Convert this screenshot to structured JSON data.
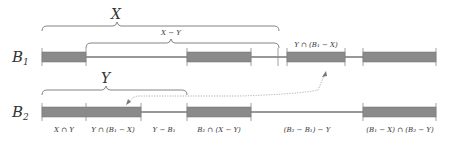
{
  "diagram": {
    "colors": {
      "bar_fill": "#8a8a8a",
      "bar_stroke": "#6e6e6e",
      "line": "#333333",
      "tick": "#888888",
      "brace": "#777777",
      "dotted": "#999999",
      "text": "#333333"
    },
    "rows": [
      {
        "id": "B1",
        "label": "B",
        "subscript": "1",
        "segments": [
          {
            "type": "block",
            "x0": 42,
            "x1": 86
          },
          {
            "type": "line",
            "x0": 86,
            "x1": 187
          },
          {
            "type": "block",
            "x0": 187,
            "x1": 251
          },
          {
            "type": "line",
            "x0": 251,
            "x1": 287
          },
          {
            "type": "block",
            "x0": 287,
            "x1": 345
          },
          {
            "type": "line",
            "x0": 345,
            "x1": 363
          },
          {
            "type": "block",
            "x0": 363,
            "x1": 436
          }
        ],
        "ticks": [
          42,
          86,
          187,
          251,
          278,
          287,
          345,
          363,
          436
        ]
      },
      {
        "id": "B2",
        "label": "B",
        "subscript": "2",
        "segments": [
          {
            "type": "block",
            "x0": 42,
            "x1": 141
          },
          {
            "type": "line",
            "x0": 141,
            "x1": 187
          },
          {
            "type": "block",
            "x0": 187,
            "x1": 251
          },
          {
            "type": "line",
            "x0": 251,
            "x1": 363
          },
          {
            "type": "block",
            "x0": 363,
            "x1": 436
          }
        ],
        "ticks": [
          42,
          86,
          141,
          187,
          251,
          363,
          436
        ]
      }
    ],
    "braces": [
      {
        "id": "X",
        "label": "X",
        "x0": 42,
        "x1": 279,
        "y": 26
      },
      {
        "id": "X-Y",
        "label": "X − Y",
        "x0": 86,
        "x1": 279,
        "y": 43
      },
      {
        "id": "Y",
        "label": "Y",
        "x0": 42,
        "x1": 187,
        "y": 90
      }
    ],
    "annotations": {
      "above_b1": "Y ∩ (B₁ − X)",
      "below_b2": [
        "X ∩ Y",
        "Y ∩ (B₁ − X)",
        "Y − B₁",
        "B₂ ∩ (X − Y)",
        "(B₂ − B₁) − Y",
        "(B₁ − X) ∩ (B₂ − Y)"
      ]
    },
    "arrow": {
      "style": "dotted",
      "description": "links Y ∩ (B1 − X) block on B2 to the corresponding block on B1"
    }
  }
}
